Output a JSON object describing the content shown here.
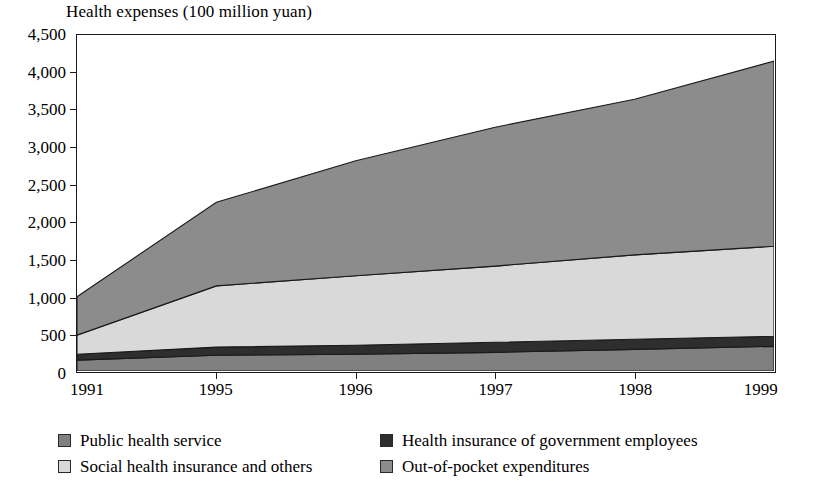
{
  "chart_data": {
    "type": "area",
    "stacked": true,
    "title": "Health expenses (100 million yuan)",
    "xlabel": "",
    "ylabel": "",
    "categories": [
      "1991",
      "1995",
      "1996",
      "1997",
      "1998",
      "1999"
    ],
    "x_tick_labels": [
      "1991",
      "1995",
      "1996",
      "1997",
      "1998",
      "1999"
    ],
    "y_tick_labels": [
      "0",
      "500",
      "1,000",
      "1,500",
      "2,000",
      "2,500",
      "3,000",
      "3,500",
      "4,000",
      "4,500"
    ],
    "y_tick_values": [
      0,
      500,
      1000,
      1500,
      2000,
      2500,
      3000,
      3500,
      4000,
      4500
    ],
    "ylim": [
      0,
      4500
    ],
    "grid": false,
    "legend_position": "bottom",
    "series": [
      {
        "name": "Public health service",
        "color": "#808080",
        "values": [
          145,
          210,
          225,
          250,
          290,
          330
        ]
      },
      {
        "name": "Health insurance of government employees",
        "color": "#2e2e2e",
        "values": [
          80,
          110,
          120,
          135,
          135,
          135
        ]
      },
      {
        "name": "Social health insurance and others",
        "color": "#d9d9d9",
        "values": [
          255,
          820,
          930,
          1020,
          1130,
          1205
        ]
      },
      {
        "name": "Out-of-pocket expenditures",
        "color": "#8c8c8c",
        "values": [
          515,
          1120,
          1540,
          1860,
          2085,
          2480
        ]
      }
    ],
    "cumulative_totals": [
      995,
      2260,
      2815,
      3265,
      3640,
      4150
    ]
  },
  "legend": {
    "rows": [
      [
        {
          "label": "Public health service",
          "swatch": "#808080",
          "name": "legend-public-health-service"
        },
        {
          "label": "Health insurance of government employees",
          "swatch": "#2e2e2e",
          "name": "legend-health-insurance-government-employees"
        }
      ],
      [
        {
          "label": "Social health insurance and others",
          "swatch": "#d9d9d9",
          "name": "legend-social-health-insurance"
        },
        {
          "label": "Out-of-pocket expenditures",
          "swatch": "#8c8c8c",
          "name": "legend-out-of-pocket-expenditures"
        }
      ]
    ]
  }
}
